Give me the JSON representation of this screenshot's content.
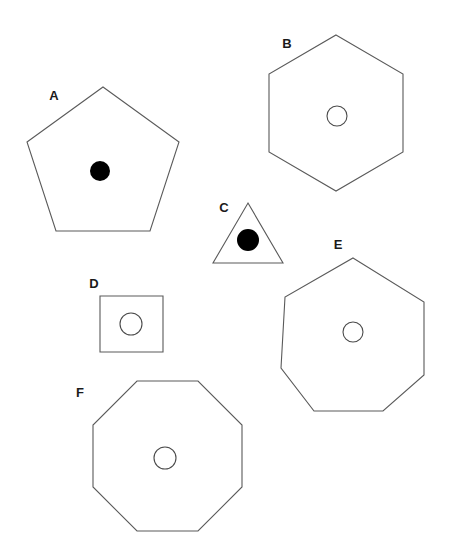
{
  "figure": {
    "background_color": "#ffffff",
    "outline_color": "#5a5a5a",
    "marker_filled_color": "#000000",
    "marker_hollow_fill": "#ffffff",
    "label_color": "#1a1a1a",
    "width": 455,
    "height": 545
  },
  "shapes": [
    {
      "label": "A",
      "polygon_name": "pentagon",
      "sides": 5,
      "label_x": 54,
      "label_y": 97,
      "center_x": 103,
      "center_y": 167,
      "radius": 80,
      "rotation_deg": -90,
      "points": "103,87 179,142 150,231 56,231 27,142",
      "marker": {
        "type": "filled-circle",
        "cx": 100,
        "cy": 171,
        "r": 10
      }
    },
    {
      "label": "B",
      "polygon_name": "hexagon",
      "sides": 6,
      "label_x": 287,
      "label_y": 45,
      "center_x": 336,
      "center_y": 113,
      "radius": 78,
      "rotation_deg": -90,
      "points": "336,35 403,74 403,152 336,191 269,152 269,74",
      "marker": {
        "type": "hollow-circle",
        "cx": 337,
        "cy": 116,
        "r": 10
      }
    },
    {
      "label": "C",
      "polygon_name": "triangle",
      "sides": 3,
      "label_x": 224,
      "label_y": 209,
      "center_x": 248,
      "center_y": 243,
      "radius": 40,
      "rotation_deg": -90,
      "points": "248,203 283,263 213,263",
      "marker": {
        "type": "filled-circle",
        "cx": 248,
        "cy": 240,
        "r": 11
      }
    },
    {
      "label": "D",
      "polygon_name": "square",
      "sides": 4,
      "label_x": 94,
      "label_y": 285,
      "center_x": 131,
      "center_y": 324,
      "radius": 38,
      "rotation_deg": 0,
      "points": "100,296 163,296 163,352 100,352",
      "marker": {
        "type": "hollow-circle",
        "cx": 131,
        "cy": 324,
        "r": 11
      }
    },
    {
      "label": "E",
      "polygon_name": "heptagon",
      "sides": 7,
      "label_x": 338,
      "label_y": 246,
      "center_x": 353,
      "center_y": 336,
      "radius": 78,
      "rotation_deg": -90,
      "points": "353,258 424,302 424,375 383,411 314,411 281,368 285,297",
      "marker": {
        "type": "hollow-circle",
        "cx": 353,
        "cy": 332,
        "r": 10
      }
    },
    {
      "label": "F",
      "polygon_name": "octagon",
      "sides": 8,
      "label_x": 80,
      "label_y": 394,
      "center_x": 167,
      "center_y": 456,
      "radius": 79,
      "rotation_deg": -112.5,
      "points": "137,381 198,381 242,425 242,487 198,531 137,531 93,487 93,425",
      "marker": {
        "type": "hollow-circle",
        "cx": 165,
        "cy": 458,
        "r": 11
      }
    }
  ]
}
